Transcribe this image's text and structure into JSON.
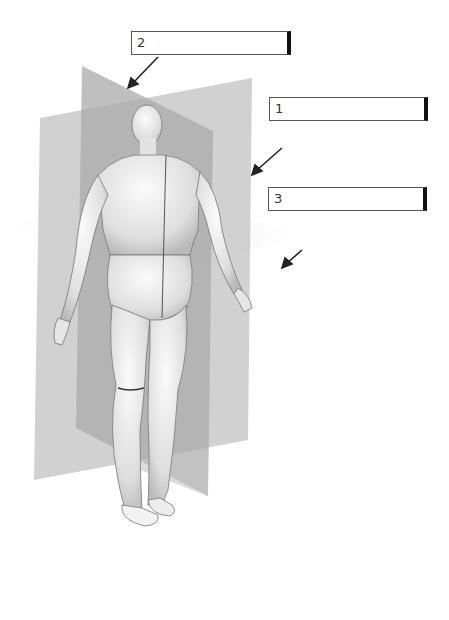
{
  "diagram": {
    "labels": [
      {
        "number": "1",
        "value": "",
        "placeholder": ""
      },
      {
        "number": "2",
        "value": "",
        "placeholder": ""
      },
      {
        "number": "3",
        "value": "",
        "placeholder": ""
      }
    ],
    "planes": [
      {
        "id": "coronal",
        "label_ref": "1"
      },
      {
        "id": "sagittal",
        "label_ref": "2"
      },
      {
        "id": "transverse",
        "label_ref": "3"
      }
    ],
    "colors": {
      "plane_light": "#c8c8c8",
      "plane_dark": "#a8a8a8",
      "body": "#e8e8e8",
      "arrow": "#222222",
      "box_border": "#555555"
    }
  }
}
